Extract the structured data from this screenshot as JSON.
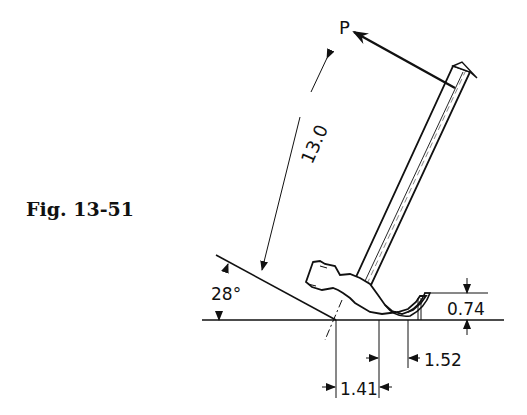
{
  "figure": {
    "caption": "Fig. 13-51"
  },
  "labels": {
    "force": "P",
    "length": "13.0",
    "angle": "28°",
    "height": "0.74",
    "offset_right": "1.52",
    "offset_left": "1.41"
  },
  "colors": {
    "ink": "#111111",
    "background": "#ffffff"
  }
}
